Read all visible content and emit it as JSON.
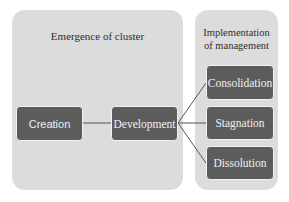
{
  "diagram": {
    "type": "process-flow",
    "colors": {
      "background": "#ffffff",
      "panel_fill": "#dcdcdc",
      "node_fill": "#5c5c5c",
      "node_text": "#f0f0f0",
      "title_text": "#2e2e2e",
      "connector": "#555555"
    },
    "panels": [
      {
        "id": "emergence",
        "title": "Emergence of cluster"
      },
      {
        "id": "implementation",
        "title_line1": "Implementation",
        "title_line2": "of management"
      }
    ],
    "nodes": {
      "creation": "Creation",
      "development": "Development",
      "consolidation": "Consolidation",
      "stagnation": "Stagnation",
      "dissolution": "Dissolution"
    },
    "edges": [
      {
        "from": "Creation",
        "to": "Development"
      },
      {
        "from": "Development",
        "to": "Consolidation"
      },
      {
        "from": "Development",
        "to": "Stagnation"
      },
      {
        "from": "Development",
        "to": "Dissolution"
      }
    ]
  }
}
